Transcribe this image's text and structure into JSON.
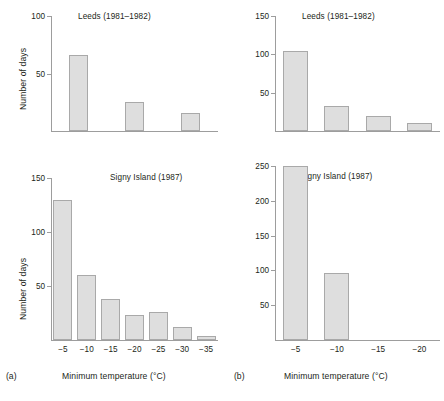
{
  "figure": {
    "background": "#ffffff",
    "bar_fill": "#dedede",
    "bar_stroke": "#a9a9a9",
    "axis_color": "#9d9d9d",
    "text_color": "#231f20"
  },
  "panels": [
    {
      "key": "top_left",
      "letter": "",
      "title": "Leeds (1981–1982)",
      "ylabel": "Number of days",
      "xlabel": "",
      "ytick_labels": [
        "50",
        "100"
      ],
      "xtick_labels": []
    },
    {
      "key": "top_right",
      "letter": "",
      "title": "Leeds (1981–1982)",
      "ylabel": "",
      "xlabel": "",
      "ytick_labels": [
        "50",
        "100",
        "150"
      ],
      "xtick_labels": []
    },
    {
      "key": "bottom_left",
      "letter": "(a)",
      "title": "Signy Island (1987)",
      "ylabel": "Number of days",
      "xlabel": "Minimum temperature (°C)",
      "ytick_labels": [
        "50",
        "100",
        "150"
      ],
      "xtick_labels": [
        "−5",
        "−10",
        "−15",
        "−20",
        "−25",
        "−30",
        "−35"
      ]
    },
    {
      "key": "bottom_right",
      "letter": "(b)",
      "title": "Signy Island (1987)",
      "ylabel": "",
      "xlabel": "Minimum temperature (°C)",
      "ytick_labels": [
        "50",
        "100",
        "150",
        "200",
        "250"
      ],
      "xtick_labels": [
        "−5",
        "−10",
        "−15",
        "−20"
      ]
    }
  ],
  "chart_data": [
    {
      "type": "bar",
      "panel": "top-left",
      "title": "Leeds (1981–1982)",
      "xlabel": "Minimum temperature (°C)",
      "ylabel": "Number of days",
      "categories": [
        "−5",
        "−10",
        "−15"
      ],
      "values": [
        66,
        25,
        16
      ],
      "ylim": [
        0,
        100
      ],
      "yticks": [
        50,
        100
      ],
      "xtick_labels_shown": false,
      "grid": false,
      "legend": false
    },
    {
      "type": "bar",
      "panel": "top-right",
      "title": "Leeds (1981–1982)",
      "xlabel": "Minimum temperature (°C)",
      "ylabel": "Number of days",
      "categories": [
        "−5",
        "−10",
        "−15",
        "−20"
      ],
      "values": [
        105,
        33,
        20,
        11
      ],
      "ylim": [
        0,
        150
      ],
      "yticks": [
        50,
        100,
        150
      ],
      "xtick_labels_shown": false,
      "grid": false,
      "legend": false
    },
    {
      "type": "bar",
      "panel": "bottom-left",
      "title": "Signy Island (1987)",
      "xlabel": "Minimum temperature (°C)",
      "ylabel": "Number of days",
      "categories": [
        "−5",
        "−10",
        "−15",
        "−20",
        "−25",
        "−30",
        "−35"
      ],
      "values": [
        130,
        60,
        38,
        23,
        26,
        12,
        4
      ],
      "ylim": [
        0,
        150
      ],
      "yticks": [
        50,
        100,
        150
      ],
      "xtick_labels_shown": true,
      "grid": false,
      "legend": false
    },
    {
      "type": "bar",
      "panel": "bottom-right",
      "title": "Signy Island (1987)",
      "xlabel": "Minimum temperature (°C)",
      "ylabel": "Number of days",
      "categories": [
        "−5",
        "−10",
        "−15",
        "−20"
      ],
      "values": [
        250,
        97,
        0,
        0
      ],
      "ylim": [
        0,
        250
      ],
      "yticks": [
        50,
        100,
        150,
        200,
        250
      ],
      "xtick_labels_shown": true,
      "grid": false,
      "legend": false
    }
  ]
}
